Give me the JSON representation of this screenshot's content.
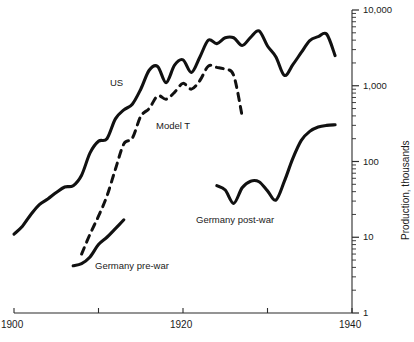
{
  "chart_data": {
    "type": "line",
    "title": "",
    "xlabel": "",
    "ylabel": "Production, thousands",
    "scale": {
      "x": "linear",
      "y": "log"
    },
    "xlim": [
      1900,
      1940
    ],
    "ylim": [
      1,
      10000
    ],
    "grid": false,
    "legend_position": "inline-annotations",
    "x_ticks": [
      {
        "value": 1900,
        "label": "1900"
      },
      {
        "value": 1910,
        "label": ""
      },
      {
        "value": 1920,
        "label": "1920"
      },
      {
        "value": 1930,
        "label": ""
      },
      {
        "value": 1940,
        "label": "1940"
      }
    ],
    "y_ticks": [
      {
        "value": 1,
        "label": "1"
      },
      {
        "value": 10,
        "label": "10"
      },
      {
        "value": 100,
        "label": "100"
      },
      {
        "value": 1000,
        "label": "1,000"
      },
      {
        "value": 10000,
        "label": "10,000"
      }
    ],
    "series": [
      {
        "name": "US",
        "style": "solid",
        "color": "#111111",
        "label": "US",
        "points": [
          [
            1900,
            11
          ],
          [
            1901,
            14
          ],
          [
            1902,
            20
          ],
          [
            1903,
            27
          ],
          [
            1904,
            32
          ],
          [
            1905,
            39
          ],
          [
            1906,
            46
          ],
          [
            1907,
            48
          ],
          [
            1908,
            66
          ],
          [
            1909,
            130
          ],
          [
            1910,
            185
          ],
          [
            1911,
            200
          ],
          [
            1912,
            365
          ],
          [
            1913,
            480
          ],
          [
            1914,
            570
          ],
          [
            1915,
            900
          ],
          [
            1916,
            1600
          ],
          [
            1917,
            1800
          ],
          [
            1918,
            1100
          ],
          [
            1919,
            1870
          ],
          [
            1920,
            2200
          ],
          [
            1921,
            1500
          ],
          [
            1922,
            2400
          ],
          [
            1923,
            4000
          ],
          [
            1924,
            3600
          ],
          [
            1925,
            4300
          ],
          [
            1926,
            4300
          ],
          [
            1927,
            3400
          ],
          [
            1928,
            4350
          ],
          [
            1929,
            5300
          ],
          [
            1930,
            3350
          ],
          [
            1931,
            2400
          ],
          [
            1932,
            1370
          ],
          [
            1933,
            1900
          ],
          [
            1934,
            2750
          ],
          [
            1935,
            3950
          ],
          [
            1936,
            4450
          ],
          [
            1937,
            4800
          ],
          [
            1938,
            2500
          ]
        ]
      },
      {
        "name": "Model T",
        "style": "dashed",
        "color": "#111111",
        "label": "Model T",
        "points": [
          [
            1908,
            6
          ],
          [
            1909,
            11
          ],
          [
            1910,
            19
          ],
          [
            1911,
            35
          ],
          [
            1912,
            79
          ],
          [
            1913,
            171
          ],
          [
            1914,
            203
          ],
          [
            1915,
            395
          ],
          [
            1916,
            501
          ],
          [
            1917,
            735
          ],
          [
            1918,
            664
          ],
          [
            1919,
            820
          ],
          [
            1920,
            1074
          ],
          [
            1921,
            903
          ],
          [
            1922,
            1173
          ],
          [
            1923,
            1817
          ],
          [
            1924,
            1749
          ],
          [
            1925,
            1643
          ],
          [
            1926,
            1368
          ],
          [
            1927,
            399
          ]
        ]
      },
      {
        "name": "Germany pre-war",
        "style": "solid",
        "color": "#111111",
        "label": "Germany pre-war",
        "points": [
          [
            1907,
            4.2
          ],
          [
            1908,
            4.5
          ],
          [
            1909,
            5.5
          ],
          [
            1910,
            8
          ],
          [
            1911,
            10
          ],
          [
            1912,
            13
          ],
          [
            1913,
            17
          ]
        ]
      },
      {
        "name": "Germany post-war",
        "style": "solid",
        "color": "#111111",
        "label": "Germany post-war",
        "points": [
          [
            1924,
            48
          ],
          [
            1925,
            42
          ],
          [
            1926,
            28
          ],
          [
            1927,
            45
          ],
          [
            1928,
            55
          ],
          [
            1929,
            54
          ],
          [
            1930,
            41
          ],
          [
            1931,
            31
          ],
          [
            1932,
            55
          ],
          [
            1933,
            110
          ],
          [
            1934,
            190
          ],
          [
            1935,
            250
          ],
          [
            1936,
            285
          ],
          [
            1937,
            300
          ],
          [
            1938,
            305
          ]
        ]
      }
    ]
  },
  "annotations": {
    "us": "US",
    "model_t": "Model T",
    "germany_prewar": "Germany pre-war",
    "germany_postwar": "Germany post-war"
  }
}
